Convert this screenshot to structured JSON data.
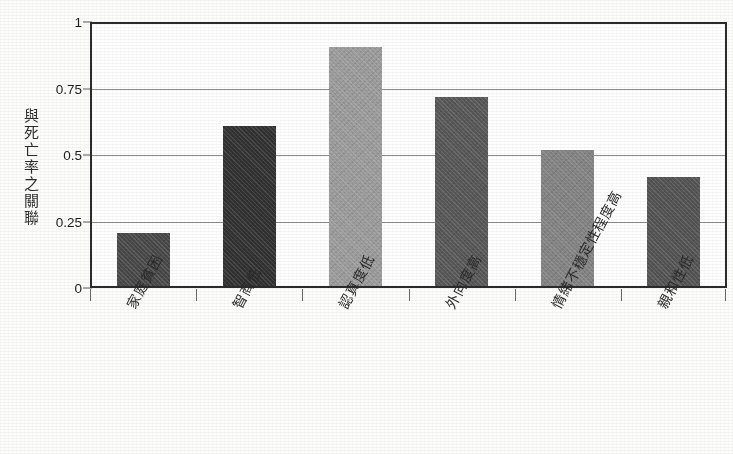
{
  "chart_data": {
    "type": "bar",
    "title": "",
    "subtitle": "",
    "xlabel": "",
    "ylabel": "與死亡率之關聯",
    "ylabel_chars": [
      "與",
      "死",
      "亡",
      "率",
      "之",
      "關",
      "聯"
    ],
    "categories": [
      "家庭貧困",
      "智商低",
      "認真度低",
      "外向度高",
      "情緒不穩定性程度高",
      "親和性低"
    ],
    "values": [
      0.2,
      0.6,
      0.9,
      0.71,
      0.51,
      0.41
    ],
    "bar_colors": [
      "#4a4a4a",
      "#333333",
      "#9d9d9d",
      "#595959",
      "#858585",
      "#555555"
    ],
    "ylim": [
      0,
      1
    ],
    "yticks": [
      0,
      0.25,
      0.5,
      0.75,
      1
    ],
    "ytick_labels": [
      "0",
      "0.25",
      "0.5",
      "0.75",
      "1"
    ],
    "grid": true,
    "legend": "none",
    "legend_position": "none",
    "frame": true
  },
  "figure": {
    "background_color": "#fdfdfc",
    "axis_color": "#2b2b2b",
    "gridline_color": "#8d8d8d",
    "text_color": "#1d1d1d"
  }
}
